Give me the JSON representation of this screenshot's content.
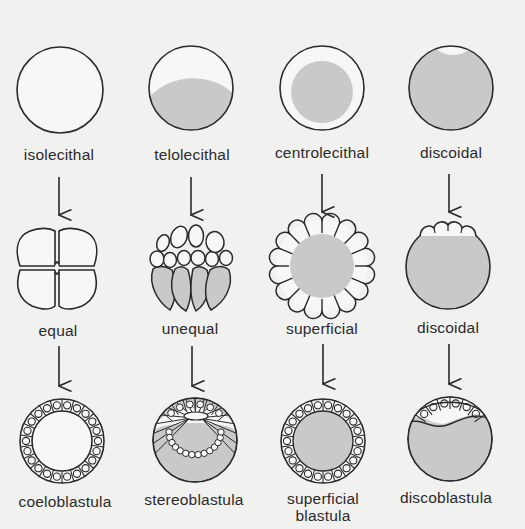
{
  "colors": {
    "background": "#f1f1ef",
    "stroke": "#2a2a2a",
    "yolk": "#c9c9c7",
    "cell_fill": "#ffffff"
  },
  "columns": [
    {
      "egg_type": "isolecithal",
      "cleavage": "equal",
      "blastula": [
        "coeloblastula"
      ]
    },
    {
      "egg_type": "telolecithal",
      "cleavage": "unequal",
      "blastula": [
        "stereoblastula"
      ]
    },
    {
      "egg_type": "centrolecithal",
      "cleavage": "superficial",
      "blastula": [
        "superficial",
        "blastula"
      ]
    },
    {
      "egg_type": "discoidal",
      "cleavage": "discoidal",
      "blastula": [
        "discoblastula"
      ]
    }
  ],
  "arrow_icon": "down-arrow-icon"
}
